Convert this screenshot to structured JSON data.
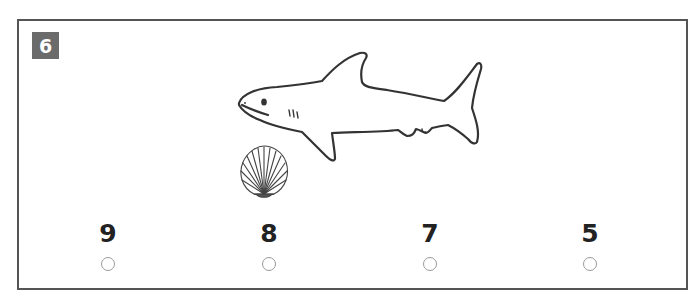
{
  "question": {
    "number": "6",
    "illustrations": [
      "shark-icon",
      "shell-icon"
    ],
    "options": [
      {
        "label": "9"
      },
      {
        "label": "8"
      },
      {
        "label": "7"
      },
      {
        "label": "5"
      }
    ]
  },
  "colors": {
    "frame": "#555555",
    "badge": "#6b6b6b",
    "radio": "#9a9a9a"
  }
}
